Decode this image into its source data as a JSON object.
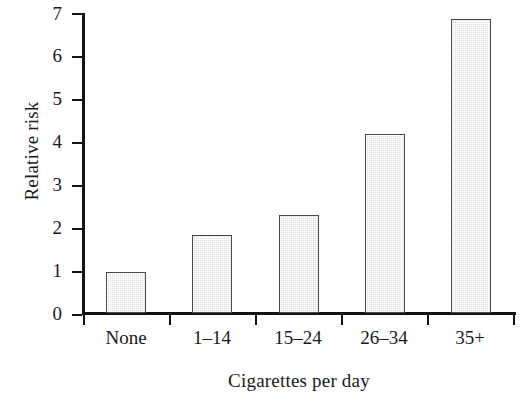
{
  "chart_data": {
    "type": "bar",
    "title": "",
    "subtitle": "",
    "xlabel": "Cigarettes per day",
    "ylabel": "Relative risk",
    "categories": [
      "None",
      "1–14",
      "15–24",
      "26–34",
      "35+"
    ],
    "values": [
      0.95,
      1.82,
      2.29,
      4.18,
      6.85
    ],
    "series": [
      {
        "name": "Relative risk",
        "values": [
          0.95,
          1.82,
          2.29,
          4.18,
          6.85
        ]
      }
    ],
    "ylim": [
      0,
      7
    ],
    "xlim_note": "categorical",
    "ytick_labels": [
      "0",
      "1",
      "2",
      "3",
      "4",
      "5",
      "6",
      "7"
    ],
    "ytick_values": [
      0,
      1,
      2,
      3,
      4,
      5,
      6,
      7
    ],
    "grid": false,
    "legend": null,
    "legend_position": "none",
    "annotations": [],
    "bar_fill_color": "#dedede",
    "bar_edge_color": "#4a4a4a",
    "axis_color": "#141414",
    "background_color": "#ffffff"
  },
  "axes": {
    "y_title": "Relative risk",
    "x_title": "Cigarettes per day"
  }
}
